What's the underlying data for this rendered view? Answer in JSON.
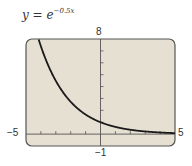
{
  "title": {
    "base": "y = e",
    "exponent": "−0.5x"
  },
  "labels": {
    "ymax": "8",
    "ymin": "−1",
    "xmin": "−5",
    "xmax": "5"
  },
  "colors": {
    "screen_bg": "#e6e0d3",
    "screen_border": "#555555",
    "curve": "#1a1a1a",
    "axis": "#555555"
  },
  "chart_data": {
    "type": "line",
    "function": "y = e^(-0.5x)",
    "xlabel": "",
    "ylabel": "",
    "xlim": [
      -5,
      5
    ],
    "ylim": [
      -1,
      8
    ],
    "xscale": 1,
    "yscale": 1,
    "grid": false,
    "x": [
      -4.16,
      -4,
      -3,
      -2,
      -1,
      0,
      1,
      2,
      3,
      4,
      5
    ],
    "series": [
      {
        "name": "y = e^(−0.5x)",
        "values": [
          8.0,
          7.39,
          4.48,
          2.72,
          1.65,
          1.0,
          0.61,
          0.37,
          0.22,
          0.14,
          0.08
        ]
      }
    ]
  }
}
